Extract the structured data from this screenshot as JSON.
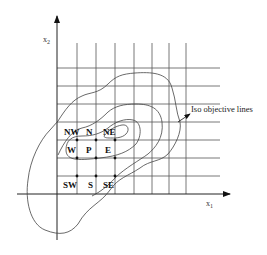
{
  "diagram": {
    "type": "grid stencil with iso-objective contour lines",
    "axes": {
      "x": {
        "label": "x",
        "subscript": "1"
      },
      "y": {
        "label": "x",
        "subscript": "2"
      }
    },
    "stencil_labels": {
      "nw": "NW",
      "n": "N",
      "ne": "NE",
      "w": "W",
      "p": "P",
      "e": "E",
      "sw": "SW",
      "s": "S",
      "se": "SE"
    },
    "annotation": "Iso objective lines",
    "colors": {
      "line": "#444444",
      "text": "#111111",
      "background": "#ffffff"
    }
  }
}
